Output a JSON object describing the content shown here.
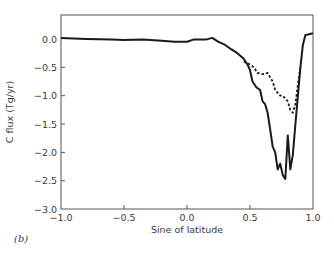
{
  "panel_label": "(b)",
  "chart_data": {
    "type": "line",
    "title": "",
    "xlabel": "Sine of latitude",
    "ylabel": "C flux (Tg/yr)",
    "xlim": [
      -1.0,
      1.0
    ],
    "ylim": [
      -3.0,
      0.3
    ],
    "x_ticks": [
      -1.0,
      -0.5,
      0.0,
      0.5,
      1.0
    ],
    "x_tick_labels": [
      "−1.0",
      "−0.5",
      "0.0",
      "0.5",
      "1.0"
    ],
    "y_ticks": [
      0.0,
      -0.5,
      -1.0,
      -1.5,
      -2.0,
      -2.5,
      -3.0
    ],
    "y_tick_labels": [
      "0.0",
      "−0.5",
      "−1.0",
      "−1.5",
      "−2.0",
      "−2.5",
      "−3.0"
    ],
    "grid": false,
    "legend": null,
    "series": [
      {
        "name": "solid",
        "style": "solid",
        "color": "#1a1a1a",
        "x": [
          -1.0,
          -0.8,
          -0.6,
          -0.5,
          -0.35,
          -0.2,
          -0.1,
          0.0,
          0.05,
          0.1,
          0.15,
          0.2,
          0.25,
          0.3,
          0.35,
          0.4,
          0.45,
          0.48,
          0.5,
          0.52,
          0.55,
          0.58,
          0.6,
          0.62,
          0.64,
          0.66,
          0.68,
          0.7,
          0.72,
          0.74,
          0.76,
          0.78,
          0.8,
          0.82,
          0.84,
          0.86,
          0.88,
          0.9,
          0.92,
          0.94,
          0.96,
          1.0
        ],
        "y": [
          0.02,
          0.0,
          -0.01,
          -0.02,
          -0.01,
          -0.03,
          -0.05,
          -0.05,
          -0.01,
          -0.01,
          -0.01,
          0.02,
          -0.05,
          -0.1,
          -0.18,
          -0.25,
          -0.35,
          -0.45,
          -0.55,
          -0.75,
          -0.85,
          -0.9,
          -1.1,
          -1.15,
          -1.3,
          -1.6,
          -1.9,
          -2.0,
          -2.3,
          -2.2,
          -2.4,
          -2.47,
          -1.7,
          -2.3,
          -2.05,
          -1.5,
          -1.0,
          -0.5,
          -0.1,
          0.07,
          0.08,
          0.1
        ]
      },
      {
        "name": "dashed",
        "style": "dashed",
        "color": "#1a1a1a",
        "x": [
          0.45,
          0.5,
          0.53,
          0.56,
          0.6,
          0.64,
          0.68,
          0.7,
          0.72,
          0.74,
          0.76,
          0.78,
          0.8,
          0.82,
          0.84,
          0.86,
          0.88,
          0.9
        ],
        "y": [
          -0.4,
          -0.45,
          -0.5,
          -0.6,
          -0.62,
          -0.6,
          -0.75,
          -0.9,
          -0.95,
          -1.0,
          -1.0,
          -1.05,
          -1.1,
          -1.25,
          -1.3,
          -1.15,
          -0.8,
          -0.5
        ]
      }
    ]
  }
}
